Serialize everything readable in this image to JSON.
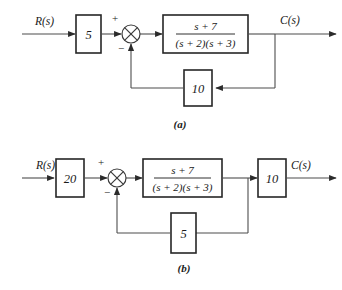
{
  "figure": {
    "kind": "control-system-block-diagram",
    "subfigures": [
      {
        "id": "a",
        "caption": "(a)",
        "input_label": "R(s)",
        "output_label": "C(s)",
        "forward_gain": "5",
        "plant_numerator": "s + 7",
        "plant_denominator": "(s + 2)(s + 3)",
        "feedback_gain": "10",
        "summer_plus": "+",
        "summer_minus": "−"
      },
      {
        "id": "b",
        "caption": "(b)",
        "input_label": "R(s)",
        "output_label": "C(s)",
        "forward_gain": "20",
        "plant_numerator": "s + 7",
        "plant_denominator": "(s + 2)(s + 3)",
        "output_gain": "10",
        "feedback_gain": "5",
        "summer_plus": "+",
        "summer_minus": "−"
      }
    ]
  },
  "colors": {
    "wire": "#4d4d4d",
    "box_border": "#262626",
    "text": "#1a1a1a",
    "background": "#ffffff"
  }
}
